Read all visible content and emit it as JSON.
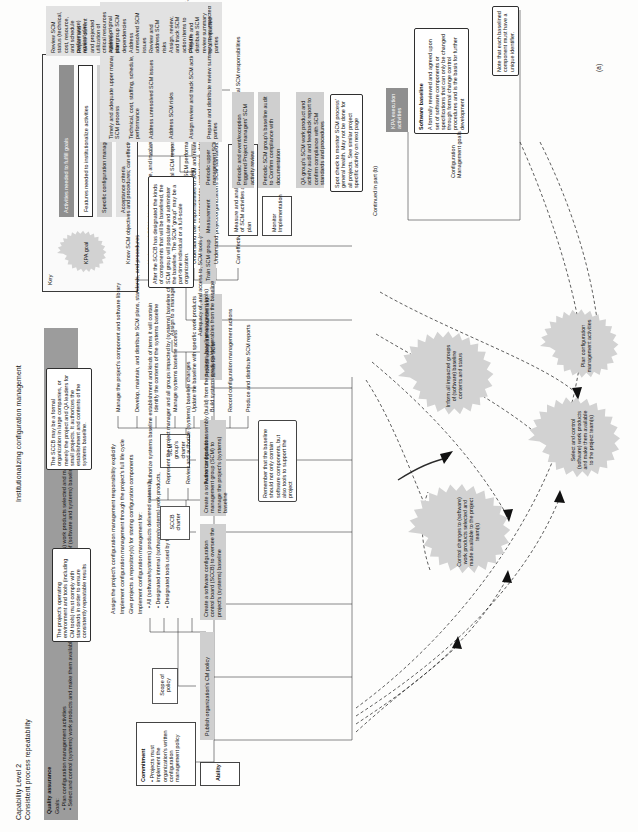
{
  "figure": {
    "part_label": "(a)",
    "continued_note": "Continued in part (b)",
    "header_title": "Institutionalizing configuration management",
    "level_title": "Capability Level 2",
    "level_subtitle": "Consistent process repeatability"
  },
  "key": {
    "title": "Key",
    "kpa_goal": "KPA goal",
    "items": [
      "Activities needed to fulfill goals",
      "Features needed to institutionalize activities",
      "Specific configuration management activities",
      "Acceptance criteria"
    ]
  },
  "goals_band": {
    "quality": "Quality assurance",
    "goals_label": "Goals:",
    "goals": [
      "Plan configuration management activities",
      "Select and control (systems) work products and make them available to project team(s)",
      "Control changes to (systems) work products selected and made available to project team(s)",
      "Inform all impacted groups of (software and systems) baseline contents and status"
    ]
  },
  "kpa_goals": [
    {
      "name": "goal-plan",
      "text": "Plan configuration management activities"
    },
    {
      "name": "goal-select-control",
      "text": "Select and control (software) work products and make them available to the project team(s)"
    },
    {
      "name": "goal-control-changes",
      "text": "Control changes to (software) work products selected and made available to the project team(s)"
    },
    {
      "name": "goal-inform",
      "text": "Inform all impacted groups of (software) baseline contents and status"
    }
  ],
  "institutional": {
    "commitment_label": "Commitment",
    "commitment_bullets": [
      "Projects must implement the organization's written configuration management policy"
    ],
    "ability_label": "Ability",
    "ability_items": [
      "Create a software configuration control board (SCCB) to oversee the project's (systems) baseline",
      "Create a software configuration management group (SCM) to manage the project's (systems) baseline",
      "Provide adequate resources and funds for SCM",
      "Train SCM group"
    ],
    "measurement_label": "Measurement",
    "measurement_items": [
      "Measure and analyze: track status of SCM activities against baseline plan"
    ],
    "monitor_label": "Monitor Implementation",
    "monitor_items": [
      "Periodic and event/exception triggered Project managers' SCM activity review",
      "Periodic SCM group's baseline audit to Confirm compliance with documentation",
      "QA group's SCM work product and activity audit and feedback report to confirm compliance with SCM standards and procedures"
    ],
    "kpa_execution_label": "KPA execution activities",
    "scope_of_policy_label": "Scope of policy",
    "publish_policy_label": "Publish organization's CM policy",
    "sccb_charter_label": "SCCB charter",
    "scm_charter_label": "SCM group's charter"
  },
  "policy_items": [
    "Assign the project's configuration management responsibility explicitly",
    "Implement configuration management through the project's full life cycle",
    "Give projects a repository(s) for storing configuration components",
    "Implement configuration management for:",
    "All (software/systems) products delivered externally",
    "Designated internal (software/systems) work products,",
    "Designated tools used by the project"
  ],
  "policy_sub_bullets": [
    "All (software/systems) products delivered externally",
    "Designated internal (software/systems) work products,",
    "Designated tools used by the project"
  ],
  "sccb_activities": [
    "Authorize systems baseline establishment and kinds of items it will contain",
    "Represent the project manager and all groups impacted by (systems) baseline changes",
    "Review and authorize (systems) baseline changes",
    "Authorize product assembly (build) from the systems baseline"
  ],
  "scm_activities": [
    "Manage the project's component and software library",
    "Develop, maintain, and distribute SCM plans, standards, and procedures",
    "Identify the contents of the systems baseline",
    "Manage systems baseline access",
    "Update the baseline with specific work products",
    "Build systems products/deliverables from the baseline",
    "Record configuration management actions",
    "Produce and distribute SCM reports"
  ],
  "resources_activities": [
    "Assign to a manager a specific project SCM responsibility",
    "Adequacy of, and access to, SCM tools (such as repositories, workstations, databases and other configuration management tools)"
  ],
  "training_activities": [
    "Know SCM objectives and procedures; can effectively use methods and tools",
    "Understand SCM objectives, practice, and involvement in software activities",
    "Understand their group and individual SCM responsibilities",
    "Understand role responsibilities of SCM and related groups; their interfaces, and protocols",
    "Understand project/organization's SCM standards, methods, and procedures",
    "Can effectively use SCM methods and tools needed to fill their individual SCM responsibilities"
  ],
  "measurement_activities": [
    "Measure SCM performance: resources, milestones, activity status, schedule, cost, change request volumes, etc. against baseline plan"
  ],
  "upper_mgmt_review": {
    "header": "Periodic upper management SCM review",
    "items": [
      "Timely and adequate upper management insight into SCM process",
      "Technical, cost, staffing, schedule, tracking performance",
      "Address unresolved SCM issues",
      "Address SCM risks",
      "Assign review and track SCM action items to closure",
      "Prepare and distribute review summary to all impacted parties"
    ]
  },
  "project_mgr_review": {
    "items": [
      "Review SCM status (technical, cost, resource, and schedule performance) against plan",
      "Report and review current and projected utilization of critical resources against original plan",
      "Address intergroup SCM dependencies",
      "Address unresolved SCM issues",
      "Review and address SCM risks",
      "Assign, review, and track SCM action items to closure",
      "Prepare and distribute SCM review summary to all impacted parties"
    ]
  },
  "callouts": [
    {
      "name": "callout-operating-environment",
      "text": "The project's operating environment and tools (including CM tools) must comply with standards in order to ensure consistently repeatable results"
    },
    {
      "name": "callout-sccb",
      "text": "The SCCB may be a formal organization in large companies, or merely the project and QA leaders for small projects. It authorizes the establishment and contents of the systems baseline."
    },
    {
      "name": "callout-scm-group",
      "text": "After the SCCB has designated the kinds of components that will be baselined, the SCM group will populate and administer the baseline. The SCM \"group\" may be a part-time individual or a full-scale organization."
    },
    {
      "name": "callout-baseline-tools",
      "text": "Remember that the baseline should not only contain software components, but also tools to support the project"
    },
    {
      "name": "callout-spot-check",
      "text": "Spot check to monitor SCM process' general health. May not be done for all projects. See similar project specific activity on next page"
    },
    {
      "name": "callout-software-baseline",
      "title": "Software baseline",
      "text": "A formally reviewed and agreed upon set of software components or specifications that can only be changed through formal change control procedures and is the basis for further development"
    },
    {
      "name": "callout-unique-identifier",
      "text": "Note that each baselined component must have a unique identifier."
    }
  ],
  "cm_goals_label": "Configuration Management goals",
  "colors": {
    "dark": "#8f8f8f",
    "gray": "#cfcfcf",
    "light_gray": "#e2e2e2",
    "band": "#9c9c9c",
    "starburst": "#d2d2d2",
    "line": "#2b2b2b"
  }
}
